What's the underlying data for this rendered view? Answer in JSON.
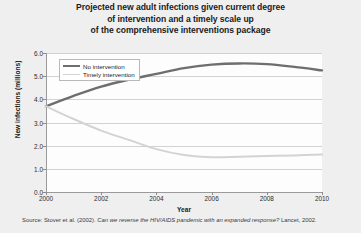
{
  "title": {
    "line1": "Projected new adult infections given current degree",
    "line2": "of intervention and a timely scale up",
    "line3": "of the comprehensive interventions package"
  },
  "source": {
    "prefix": "Source: Stover et al. (2002).",
    "italic": "Can we reverse the HIV/AIDS pandemic with an expanded response?",
    "suffix": "Lancet, 2002."
  },
  "colors": {
    "no_intervention": "#6e6e6e",
    "timely_intervention": "#d3d3d3",
    "gridline": "#d2d2d2",
    "axis": "#9a9a9a",
    "page_background": "#efeff0",
    "plot_background": "#fdfdfd",
    "text": "#1b1b1b"
  },
  "chart_data": {
    "type": "line",
    "title": "Projected new adult infections given current degree of intervention and a timely scale up of the comprehensive interventions package",
    "xlabel": "Year",
    "ylabel": "New infections (millions)",
    "xlim": [
      2000,
      2010
    ],
    "ylim": [
      0.0,
      6.0
    ],
    "grid": true,
    "legend_position": "top-left",
    "x_ticks": [
      "2000",
      "2002",
      "2004",
      "2006",
      "2008",
      "2010"
    ],
    "x_tick_values": [
      2000,
      2002,
      2004,
      2006,
      2008,
      2010
    ],
    "y_ticks": [
      "0.0",
      "1.0",
      "2.0",
      "3.0",
      "4.0",
      "5.0",
      "6.0"
    ],
    "y_tick_values": [
      0.0,
      1.0,
      2.0,
      3.0,
      4.0,
      5.0,
      6.0
    ],
    "x": [
      2000,
      2001,
      2002,
      2003,
      2004,
      2005,
      2006,
      2007,
      2008,
      2009,
      2010
    ],
    "series": [
      {
        "name": "No intervention",
        "color": "#6e6e6e",
        "values": [
          3.7,
          4.15,
          4.55,
          4.85,
          5.1,
          5.35,
          5.5,
          5.55,
          5.52,
          5.4,
          5.25
        ]
      },
      {
        "name": "Timely intervention",
        "color": "#d3d3d3",
        "values": [
          3.7,
          3.15,
          2.65,
          2.25,
          1.85,
          1.6,
          1.5,
          1.52,
          1.55,
          1.58,
          1.62
        ]
      }
    ]
  }
}
